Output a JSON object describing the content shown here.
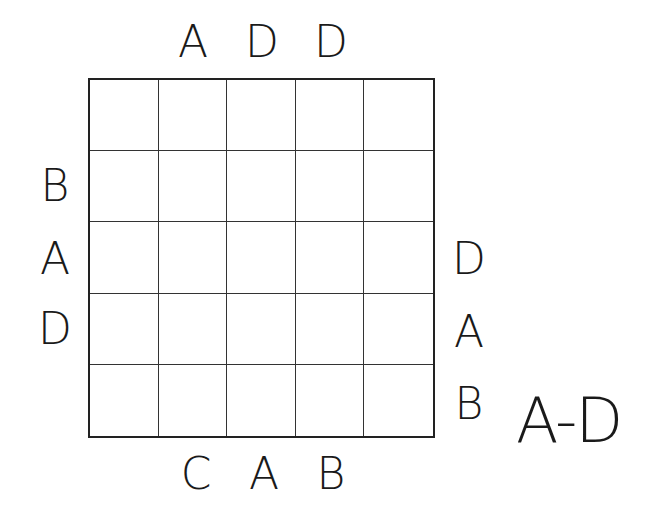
{
  "puzzle": {
    "type": "Easy as ABC",
    "size": 5,
    "letter_range": "A-D",
    "clues": {
      "top": [
        "",
        "A",
        "D",
        "D",
        ""
      ],
      "bottom": [
        "",
        "C",
        "A",
        "B",
        ""
      ],
      "left": [
        "",
        "B",
        "A",
        "D",
        ""
      ],
      "right": [
        "",
        "",
        "D",
        "A",
        "B"
      ]
    },
    "cells": [
      [
        "",
        "",
        "",
        "",
        ""
      ],
      [
        "",
        "",
        "",
        "",
        ""
      ],
      [
        "",
        "",
        "",
        "",
        ""
      ],
      [
        "",
        "",
        "",
        "",
        ""
      ],
      [
        "",
        "",
        "",
        "",
        ""
      ]
    ]
  }
}
